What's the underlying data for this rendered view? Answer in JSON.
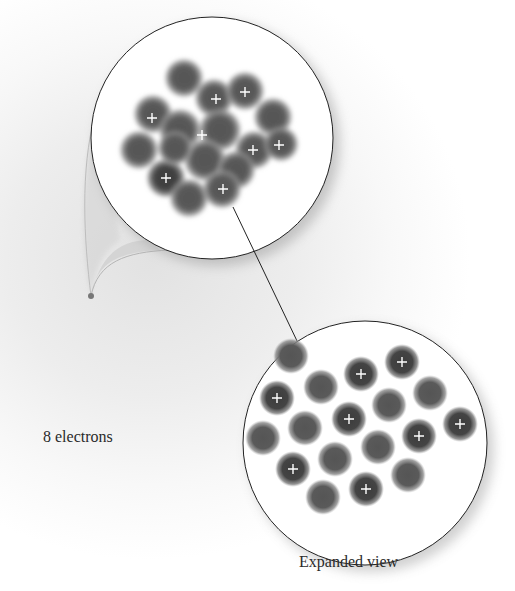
{
  "figure": {
    "labels": {
      "electrons": "8 electrons",
      "expanded": "Expanded view"
    },
    "nucleus_view": {
      "description": "Compact nucleus cluster with 8 protons (+) and neutrons",
      "proton_symbol": "+",
      "proton_count": 8
    },
    "expanded_view": {
      "description": "Expanded nucleus showing 8 protons (+) and 10 neutrons",
      "proton_symbol": "+",
      "proton_count": 8,
      "neutron_count": 10
    },
    "colors": {
      "particle": "#4a4a4a",
      "circle_outline": "#222222",
      "plus": "#ffffff"
    }
  }
}
